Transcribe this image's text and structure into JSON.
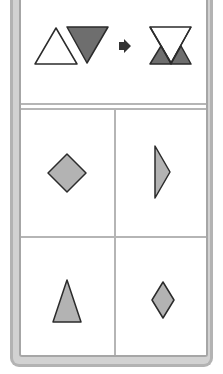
{
  "puzzle": {
    "question_panel": {
      "left_shapes": [
        {
          "shape": "triangle-up",
          "fill": "#ffffff"
        },
        {
          "shape": "triangle-down",
          "fill": "#6e6e6e"
        }
      ],
      "operator": "arrow-right",
      "result_shape": {
        "shape": "hourglass",
        "top_fill": "#ffffff",
        "bottom_fills": [
          "#6e6e6e",
          "#6e6e6e"
        ]
      }
    },
    "options": [
      {
        "position": "top-left",
        "shape": "diamond-square",
        "fill": "#b3b3b3"
      },
      {
        "position": "top-right",
        "shape": "triangle-right-narrow",
        "fill": "#b3b3b3"
      },
      {
        "position": "bottom-left",
        "shape": "triangle-up-tall",
        "fill": "#b3b3b3"
      },
      {
        "position": "bottom-right",
        "shape": "diamond-narrow",
        "fill": "#b3b3b3"
      }
    ],
    "colors": {
      "frame": "#b3b3b3",
      "divider": "#b5b5b5",
      "stroke": "#2b2b2b",
      "dark_fill": "#6e6e6e",
      "light_fill": "#b3b3b3"
    }
  }
}
